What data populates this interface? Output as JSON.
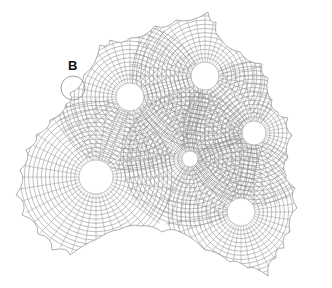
{
  "diagram": {
    "label": "B",
    "label_pos": [
      73,
      67
    ],
    "detail_circle": {
      "cx": 73,
      "cy": 88,
      "r": 12
    },
    "line_color": "#8a8a8a",
    "outline": [
      [
        50,
        120
      ],
      [
        66,
        104
      ],
      [
        70,
        93
      ],
      [
        84,
        75
      ],
      [
        100,
        45
      ],
      [
        110,
        40
      ],
      [
        130,
        38
      ],
      [
        155,
        26
      ],
      [
        176,
        20
      ],
      [
        208,
        12
      ],
      [
        216,
        22
      ],
      [
        218,
        35
      ],
      [
        240,
        52
      ],
      [
        262,
        64
      ],
      [
        268,
        78
      ],
      [
        272,
        100
      ],
      [
        278,
        112
      ],
      [
        288,
        118
      ],
      [
        292,
        135
      ],
      [
        288,
        158
      ],
      [
        286,
        175
      ],
      [
        295,
        188
      ],
      [
        297,
        208
      ],
      [
        290,
        232
      ],
      [
        284,
        248
      ],
      [
        276,
        258
      ],
      [
        268,
        276
      ],
      [
        248,
        268
      ],
      [
        230,
        262
      ],
      [
        205,
        250
      ],
      [
        180,
        232
      ],
      [
        162,
        232
      ],
      [
        140,
        226
      ],
      [
        118,
        230
      ],
      [
        95,
        240
      ],
      [
        70,
        255
      ],
      [
        52,
        250
      ],
      [
        38,
        234
      ],
      [
        22,
        215
      ],
      [
        16,
        195
      ],
      [
        20,
        170
      ],
      [
        26,
        150
      ],
      [
        36,
        135
      ]
    ],
    "holes": [
      {
        "cx": 130,
        "cy": 97,
        "r": 14
      },
      {
        "cx": 205,
        "cy": 76,
        "r": 14
      },
      {
        "cx": 254,
        "cy": 133,
        "r": 12
      },
      {
        "cx": 190,
        "cy": 159,
        "r": 8
      },
      {
        "cx": 96,
        "cy": 177,
        "r": 17
      },
      {
        "cx": 241,
        "cy": 212,
        "r": 14
      }
    ]
  }
}
